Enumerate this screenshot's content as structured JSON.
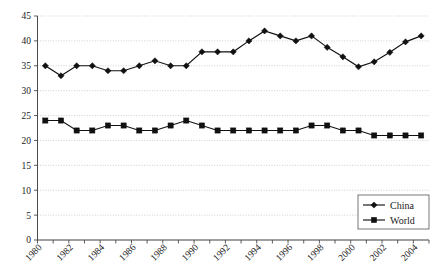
{
  "chart_data": {
    "type": "line",
    "title": "",
    "xlabel": "",
    "ylabel": "",
    "ylim": [
      0,
      45
    ],
    "ytick_step": 5,
    "yticks": [
      "0",
      "5",
      "10",
      "15",
      "20",
      "25",
      "30",
      "35",
      "40",
      "45"
    ],
    "grid": true,
    "legend_position": "bottom-right",
    "x": [
      1980,
      1981,
      1982,
      1983,
      1984,
      1985,
      1986,
      1987,
      1988,
      1989,
      1990,
      1991,
      1992,
      1993,
      1994,
      1995,
      1996,
      1997,
      1998,
      1999,
      2000,
      2001,
      2002,
      2003,
      2004
    ],
    "xticks_labeled": [
      "1980",
      "1982",
      "1984",
      "1986",
      "1988",
      "1990",
      "1992",
      "1994",
      "1996",
      "1998",
      "2000",
      "2002",
      "2004"
    ],
    "series": [
      {
        "name": "China",
        "marker": "diamond",
        "values": [
          35,
          33,
          35,
          35,
          34,
          34,
          35,
          36,
          35,
          35,
          37.8,
          37.8,
          37.8,
          40,
          42,
          41,
          40,
          41,
          38.7,
          36.8,
          34.8,
          35.8,
          37.7,
          39.8,
          41
        ]
      },
      {
        "name": "World",
        "marker": "square",
        "values": [
          24,
          24,
          22,
          22,
          23,
          23,
          22,
          22,
          23,
          24,
          23,
          22,
          22,
          22,
          22,
          22,
          22,
          23,
          23,
          22,
          22,
          21,
          21,
          21,
          21
        ]
      }
    ]
  },
  "legend": {
    "items": [
      {
        "label": "China",
        "marker": "diamond"
      },
      {
        "label": "World",
        "marker": "square"
      }
    ]
  },
  "colors": {
    "series": "#111111",
    "grid": "#b9b9b9",
    "axis": "#4a4a4a",
    "background": "#ffffff"
  }
}
